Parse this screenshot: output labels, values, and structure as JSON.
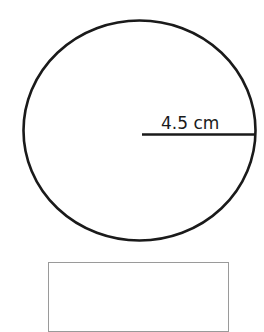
{
  "diagram": {
    "shape": "circle",
    "radius_label": "4.5 cm",
    "stroke_color": "#1a1a1a",
    "box_border_color": "#9a9a9a"
  }
}
